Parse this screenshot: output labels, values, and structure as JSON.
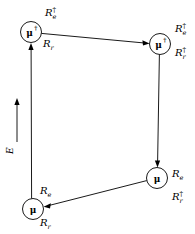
{
  "figure": {
    "background_color": "#ffffff",
    "stroke_color": "#000000"
  },
  "axis": {
    "name": "energy-axis",
    "label": "E",
    "direction": "up",
    "arrow_icon": "arrow-up-icon"
  },
  "nodes": [
    {
      "id": "top-left",
      "glyph": "μ",
      "dagger": "†",
      "has_dagger": true,
      "cx": 31,
      "cy": 32,
      "r": 10.5
    },
    {
      "id": "top-right",
      "glyph": "μ",
      "dagger": "†",
      "has_dagger": true,
      "cx": 160,
      "cy": 44,
      "r": 10.5
    },
    {
      "id": "bottom-right",
      "glyph": "μ",
      "dagger": "",
      "has_dagger": false,
      "cx": 157,
      "cy": 178,
      "r": 10.5
    },
    {
      "id": "bottom-left",
      "glyph": "μ",
      "dagger": "",
      "has_dagger": false,
      "cx": 33,
      "cy": 209,
      "r": 10.5
    }
  ],
  "operator_labels": [
    {
      "id": "top-left-upper",
      "base": "R",
      "subscript": "e",
      "dagger": "†",
      "has_dagger": true,
      "x": 45,
      "y": 16
    },
    {
      "id": "top-left-lower",
      "base": "R",
      "subscript": "r",
      "dagger": "",
      "has_dagger": false,
      "x": 43,
      "y": 47
    },
    {
      "id": "top-right-upper",
      "base": "R",
      "subscript": "e",
      "dagger": "†",
      "has_dagger": true,
      "x": 175,
      "y": 32
    },
    {
      "id": "top-right-lower",
      "base": "R",
      "subscript": "r",
      "dagger": "†",
      "has_dagger": true,
      "x": 175,
      "y": 56
    },
    {
      "id": "bottom-right-upper",
      "base": "R",
      "subscript": "e",
      "dagger": "",
      "has_dagger": false,
      "x": 172,
      "y": 177
    },
    {
      "id": "bottom-right-lower",
      "base": "R",
      "subscript": "r",
      "dagger": "†",
      "has_dagger": true,
      "x": 172,
      "y": 200
    },
    {
      "id": "bottom-left-upper",
      "base": "R",
      "subscript": "e",
      "dagger": "",
      "has_dagger": false,
      "x": 40,
      "y": 194
    },
    {
      "id": "bottom-left-lower",
      "base": "R",
      "subscript": "r",
      "dagger": "",
      "has_dagger": false,
      "x": 40,
      "y": 226
    }
  ],
  "arrows": [
    {
      "id": "top-edge",
      "from": "top-left",
      "to": "top-right",
      "direction": "left-to-right"
    },
    {
      "id": "right-edge",
      "from": "top-right",
      "to": "bottom-right",
      "direction": "downward"
    },
    {
      "id": "bottom-edge",
      "from": "bottom-right",
      "to": "bottom-left",
      "direction": "right-to-left"
    },
    {
      "id": "left-edge",
      "from": "bottom-left",
      "to": "top-left",
      "direction": "upward"
    }
  ]
}
